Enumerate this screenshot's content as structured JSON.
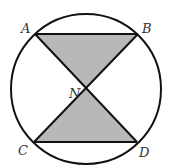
{
  "diagram": {
    "type": "geometry",
    "colors": {
      "stroke": "#111111",
      "fill_shaded": "#b8b8b8",
      "background": "#ffffff"
    },
    "circle": {
      "cx": 86,
      "cy": 89,
      "r": 75
    },
    "points": {
      "A": {
        "label": "A",
        "x": 35,
        "y": 34
      },
      "B": {
        "label": "B",
        "x": 138,
        "y": 34
      },
      "C": {
        "label": "C",
        "x": 34,
        "y": 142
      },
      "D": {
        "label": "D",
        "x": 137,
        "y": 142
      },
      "N": {
        "label": "N",
        "x": 86,
        "y": 89
      }
    },
    "shaded_triangles": [
      [
        "A",
        "B",
        "N"
      ],
      [
        "C",
        "D",
        "N"
      ]
    ],
    "segments": [
      [
        "A",
        "B"
      ],
      [
        "C",
        "D"
      ],
      [
        "A",
        "D"
      ],
      [
        "B",
        "C"
      ]
    ]
  }
}
